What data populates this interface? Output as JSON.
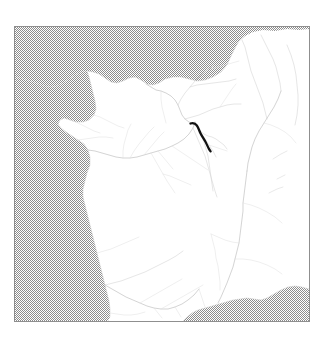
{
  "figure": {
    "kind": "map",
    "projection_note": "",
    "frame": {
      "x": 14,
      "y": 26,
      "width": 296,
      "height": 296,
      "border_color": "#8f8f8f"
    },
    "background_color": "#ffffff"
  },
  "legend_colors": {
    "sea": "#9a9a9a",
    "sea_pattern": "dither-halftone",
    "land": "#ffffff",
    "coastline": "#cfcfcf",
    "river": "#c2c2c2",
    "highlight_river": "#111111",
    "frame": "#8f8f8f"
  },
  "regions": [
    {
      "name": "english-channel",
      "type": "sea",
      "label": ""
    },
    {
      "name": "atlantic-ocean",
      "type": "sea",
      "label": ""
    },
    {
      "name": "bay-of-biscay",
      "type": "sea",
      "label": ""
    },
    {
      "name": "mediterranean-sea",
      "type": "sea",
      "label": ""
    },
    {
      "name": "france-mainland",
      "type": "land",
      "label": ""
    }
  ],
  "features": {
    "highlighted_river": {
      "name": "highlighted-river-segment",
      "stroke": "#111111",
      "stroke_width": 2.3,
      "points": [
        [
          175.5,
          96.5
        ],
        [
          179.0,
          96.0
        ],
        [
          181.5,
          97.5
        ],
        [
          183.0,
          100.0
        ],
        [
          184.5,
          103.5
        ],
        [
          186.0,
          107.0
        ],
        [
          188.0,
          110.5
        ],
        [
          190.0,
          113.5
        ],
        [
          191.5,
          116.5
        ],
        [
          193.0,
          119.5
        ],
        [
          194.5,
          122.0
        ],
        [
          195.5,
          124.0
        ]
      ]
    },
    "river_count": 46,
    "coast_segments": 4
  },
  "geometry": {
    "sea_channel": "M 0,0 L 296,0 L 296,6 L 288,5 L 274,6 L 262,4 L 250,6 L 240,4 L 232,7 L 226,10 L 222,16 L 218,22 L 214,30 L 210,38 L 206,46 L 200,52 L 192,56 L 184,58 L 176,57 L 168,54 L 160,52 L 152,52 L 146,54 L 140,58 L 134,60 L 128,58 L 122,54 L 116,52 L 110,53 L 104,56 L 98,58 L 92,56 L 86,52 L 80,48 L 74,46 L 68,46 L 62,48 L 56,52 L 50,56 L 44,60 L 38,62 L 32,62 L 26,60 L 20,58 L 14,56 L 8,54 L 0,52 Z",
    "sea_atlantic": "M 0,52 L 8,54 L 14,56 L 20,58 L 26,60 L 32,62 L 38,62 L 44,60 L 50,56 L 56,52 L 62,48 L 68,46 L 70,52 L 72,60 L 74,68 L 76,76 L 78,84 L 76,90 L 72,94 L 66,96 L 60,96 L 54,94 L 48,92 L 44,94 L 42,98 L 44,102 L 48,106 L 54,110 L 60,114 L 66,118 L 70,124 L 72,130 L 72,138 L 70,146 L 68,154 L 66,162 L 66,170 L 68,178 L 70,186 L 72,194 L 74,202 L 76,210 L 78,218 L 80,226 L 82,234 L 84,242 L 86,250 L 88,258 L 90,266 L 92,274 L 94,282 L 94,290 L 92,294 L 86,294 L 78,294 L 70,294 L 62,294 L 54,294 L 46,294 L 38,294 L 30,294 L 22,294 L 14,294 L 6,294 L 0,294 Z",
    "sea_mediterranean": "M 170,294 L 176,288 L 182,284 L 190,282 L 198,280 L 206,278 L 214,276 L 222,274 L 230,272 L 238,272 L 246,274 L 254,272 L 262,268 L 270,264 L 278,262 L 286,262 L 294,264 L 294,294 Z",
    "coast_brittany": "M 68,46 L 70,52 L 72,60 L 74,68 L 76,76 L 78,84 L 76,90 L 72,94 L 66,96 L 60,96 L 54,94 L 48,92 L 44,94 L 42,98 L 44,102 L 48,106 L 54,110 L 60,114 L 66,118 L 70,124 L 72,130 L 72,138 L 70,146 L 68,154 L 66,162 L 66,170"
  },
  "annotations": []
}
